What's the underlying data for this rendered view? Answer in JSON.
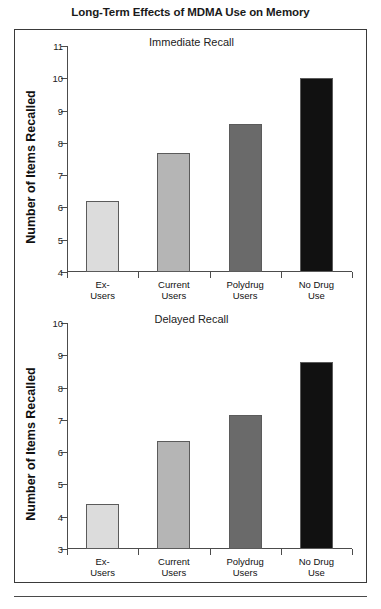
{
  "title": "Long-Term Effects of MDMA Use on Memory",
  "chart_data": [
    {
      "type": "bar",
      "title": "Immediate Recall",
      "xlabel": "",
      "ylabel": "Number of Items Recalled",
      "categories": [
        "Ex-\nUsers",
        "Current\nUsers",
        "Polydrug\nUsers",
        "No Drug\nUse"
      ],
      "values": [
        6.2,
        7.7,
        8.6,
        10.0
      ],
      "colors": [
        "#dcdcdc",
        "#b5b5b5",
        "#6a6a6a",
        "#111111"
      ],
      "ylim": [
        4,
        11
      ],
      "yticks": [
        4,
        5,
        6,
        7,
        8,
        9,
        10,
        11
      ],
      "grid": false,
      "legend": "none"
    },
    {
      "type": "bar",
      "title": "Delayed Recall",
      "xlabel": "",
      "ylabel": "Number of Items Recalled",
      "categories": [
        "Ex-\nUsers",
        "Current\nUsers",
        "Polydrug\nUsers",
        "No Drug\nUse"
      ],
      "values": [
        4.4,
        6.35,
        7.15,
        8.8
      ],
      "colors": [
        "#dcdcdc",
        "#b5b5b5",
        "#6a6a6a",
        "#111111"
      ],
      "ylim": [
        3,
        10
      ],
      "yticks": [
        3,
        4,
        5,
        6,
        7,
        8,
        9,
        10
      ],
      "grid": false,
      "legend": "none"
    }
  ]
}
